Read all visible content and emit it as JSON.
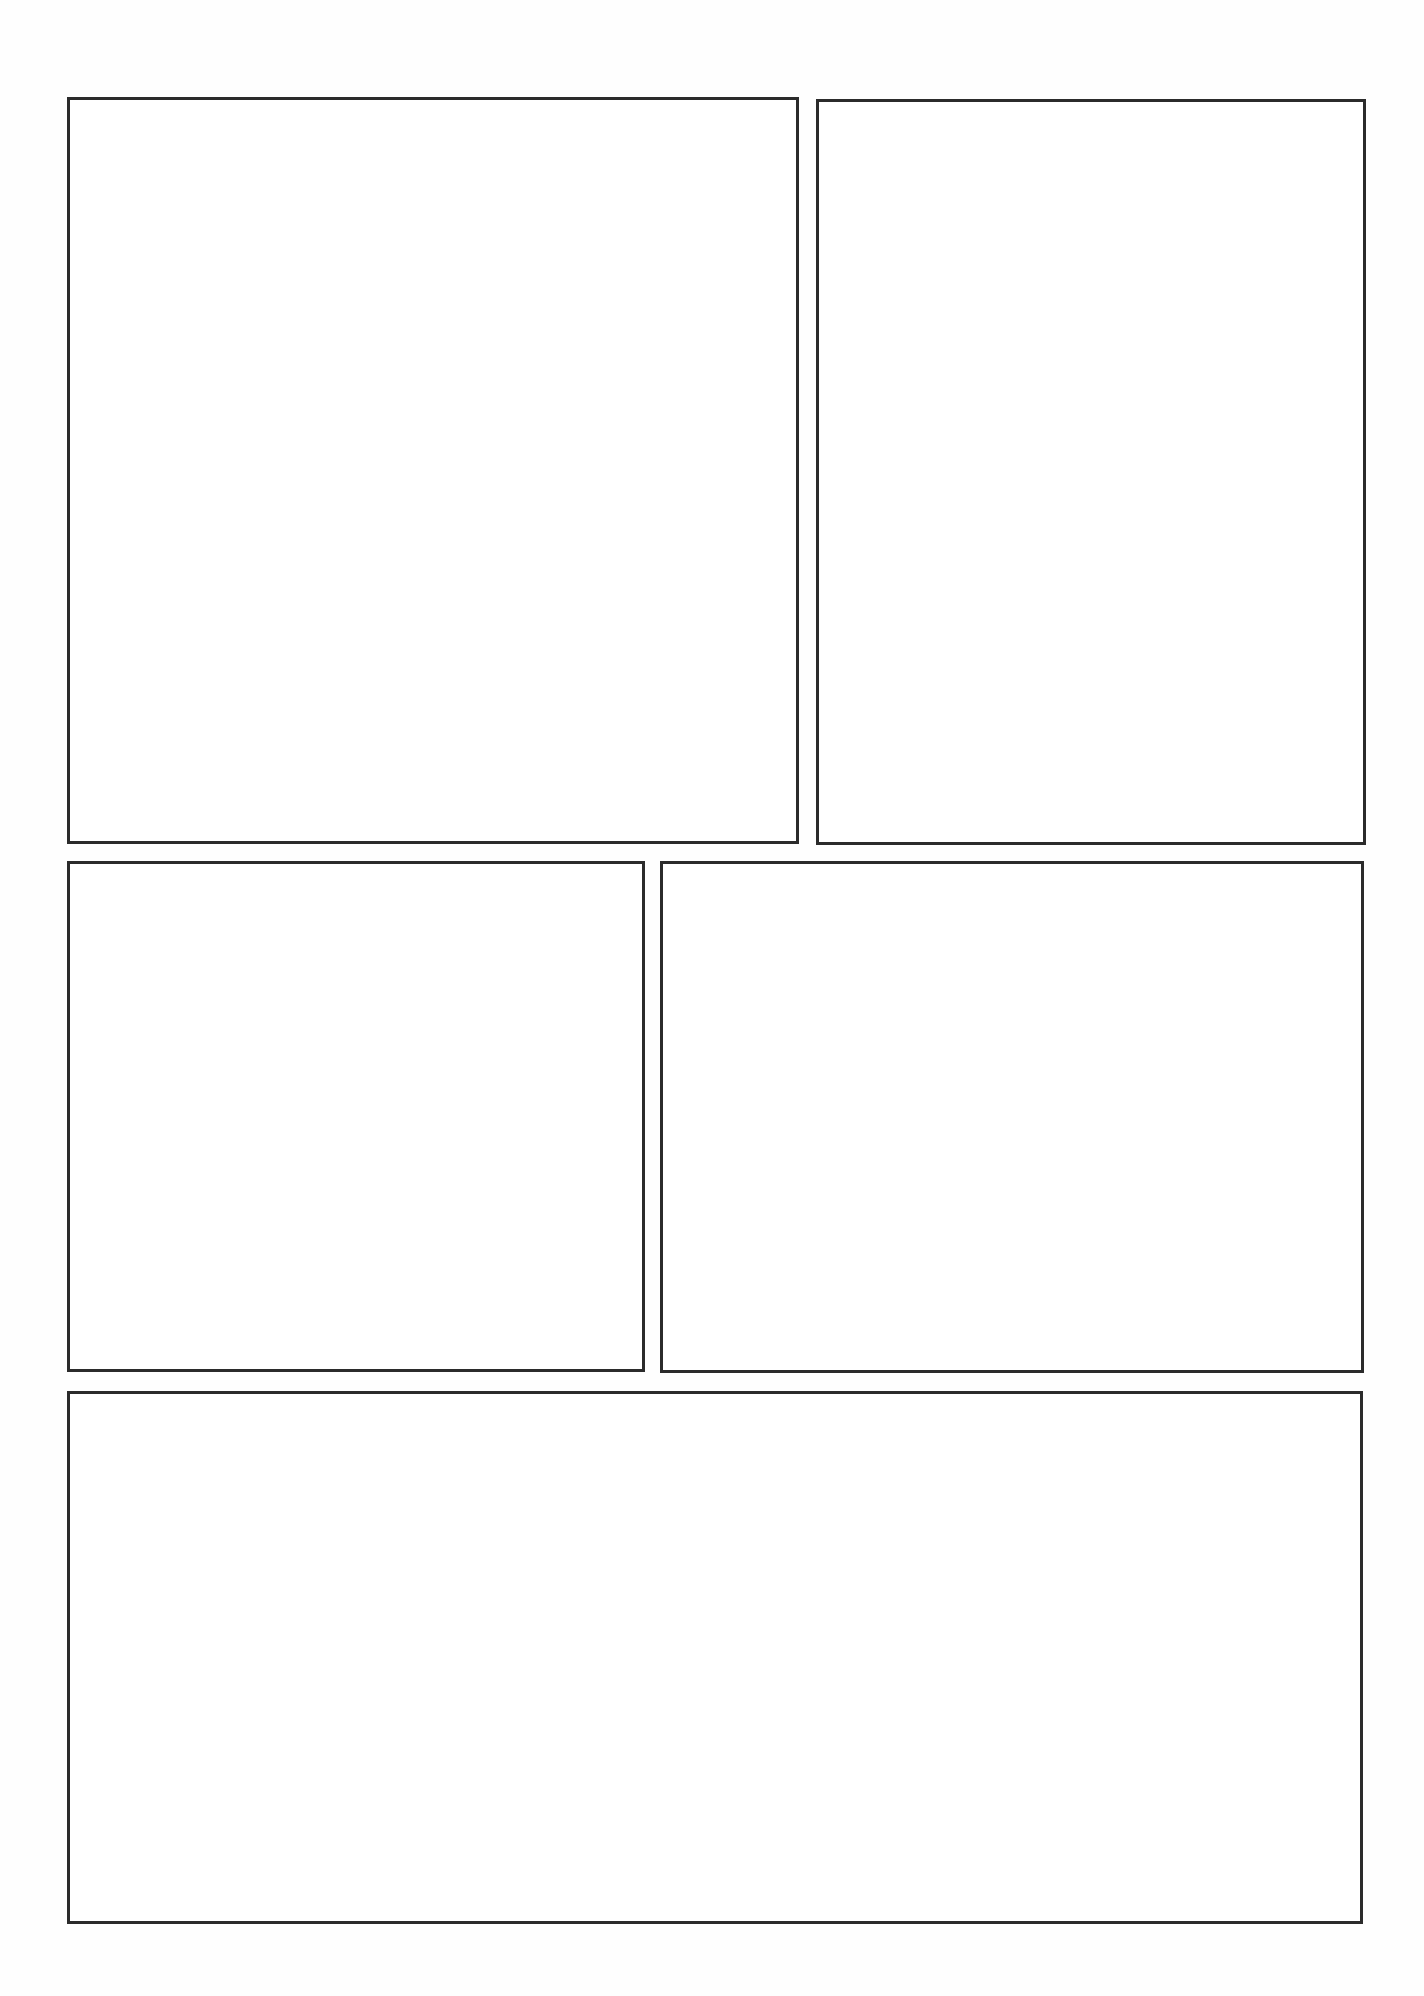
{
  "page": {
    "type": "comic-page-template",
    "background": "#ffffff",
    "border_color": "#2b2b2b",
    "panel_count": 5
  },
  "panels": [
    {
      "id": "panel-1",
      "x": 67,
      "y": 97,
      "w": 732,
      "h": 747,
      "content": ""
    },
    {
      "id": "panel-2",
      "x": 816,
      "y": 99,
      "w": 550,
      "h": 746,
      "content": ""
    },
    {
      "id": "panel-3",
      "x": 67,
      "y": 861,
      "w": 578,
      "h": 511,
      "content": ""
    },
    {
      "id": "panel-4",
      "x": 660,
      "y": 861,
      "w": 704,
      "h": 512,
      "content": ""
    },
    {
      "id": "panel-5",
      "x": 67,
      "y": 1391,
      "w": 1296,
      "h": 533,
      "content": ""
    }
  ]
}
